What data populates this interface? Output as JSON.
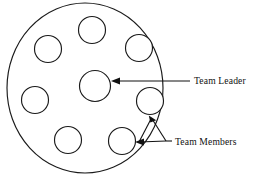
{
  "diagram": {
    "stroke_color": "#1a1a1a",
    "text_color": "#111111",
    "background_color": "#ffffff",
    "boundary": {
      "name": "team-boundary",
      "cx": 85,
      "cy": 88,
      "rx": 78,
      "ry": 85
    },
    "leader": {
      "label": "Team Leader",
      "cx": 95,
      "cy": 86,
      "r": 15.5
    },
    "members": {
      "label": "Team Members",
      "r": 13.5,
      "nodes": [
        {
          "id": "member-top",
          "cx": 92,
          "cy": 30
        },
        {
          "id": "member-upper-left",
          "cx": 48,
          "cy": 49
        },
        {
          "id": "member-upper-right",
          "cx": 139,
          "cy": 48
        },
        {
          "id": "member-left",
          "cx": 35,
          "cy": 100
        },
        {
          "id": "member-right",
          "cx": 150,
          "cy": 101
        },
        {
          "id": "member-bottom-left",
          "cx": 68,
          "cy": 140
        },
        {
          "id": "member-bottom-right",
          "cx": 122,
          "cy": 141
        }
      ]
    },
    "leader_callout": {
      "name": "leader-callout",
      "line_from_x": 190,
      "line_to_x": 114,
      "line_y": 81,
      "arrow_tip_x": 112,
      "arrow_tip_y": 81
    },
    "members_callout": {
      "name": "members-callout",
      "junction_x": 166,
      "junction_y": 140,
      "branch_upper_tip_x": 150,
      "branch_upper_tip_y": 116,
      "branch_lower_tip_x": 137,
      "branch_lower_tip_y": 142
    },
    "labels": [
      {
        "id": "label-team-leader",
        "text": "Team Leader",
        "x": 194,
        "y": 84
      },
      {
        "id": "label-team-members",
        "text": "Team Members",
        "x": 175,
        "y": 145
      }
    ]
  }
}
